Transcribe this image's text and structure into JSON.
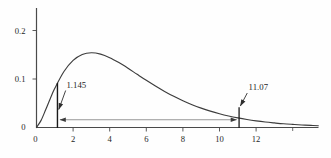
{
  "chart_data": {
    "type": "line",
    "title": "",
    "xlabel": "",
    "ylabel": "",
    "xlim": [
      0,
      15.4
    ],
    "ylim": [
      0,
      0.25
    ],
    "grid": false,
    "legend": false,
    "x_tick_values": [
      0,
      2,
      4,
      6,
      8,
      10,
      12
    ],
    "x_tick_labels": [
      "0",
      "2",
      "4",
      "6",
      "8",
      "10",
      "12"
    ],
    "x_unlabeled_tick_values": [
      14
    ],
    "y_tick_values": [
      0,
      0.1,
      0.2
    ],
    "y_tick_labels": [
      "0",
      "0.1",
      "0.2"
    ],
    "series": [
      {
        "name": "chi-square(5) pdf",
        "points": [
          [
            0,
            0
          ],
          [
            0.25,
            0.0147
          ],
          [
            0.5,
            0.0366
          ],
          [
            0.75,
            0.0594
          ],
          [
            1,
            0.0807
          ],
          [
            1.5,
            0.1154
          ],
          [
            2,
            0.1384
          ],
          [
            2.5,
            0.1506
          ],
          [
            3,
            0.1542
          ],
          [
            3.5,
            0.1513
          ],
          [
            4,
            0.144
          ],
          [
            4.5,
            0.1338
          ],
          [
            5,
            0.1221
          ],
          [
            5.5,
            0.1096
          ],
          [
            6,
            0.0973
          ],
          [
            6.5,
            0.0855
          ],
          [
            7,
            0.0744
          ],
          [
            7.5,
            0.0642
          ],
          [
            8,
            0.0551
          ],
          [
            8.5,
            0.047
          ],
          [
            9,
            0.0399
          ],
          [
            9.5,
            0.0337
          ],
          [
            10,
            0.0283
          ],
          [
            10.5,
            0.0237
          ],
          [
            11,
            0.0198
          ],
          [
            11.5,
            0.0165
          ],
          [
            12,
            0.0137
          ],
          [
            12.5,
            0.0113
          ],
          [
            13,
            0.0094
          ],
          [
            13.5,
            0.0077
          ],
          [
            14,
            0.0064
          ],
          [
            14.5,
            0.0052
          ],
          [
            15,
            0.0043
          ],
          [
            15.4,
            0.0036
          ]
        ]
      }
    ],
    "annotations": [
      {
        "label": "1.145",
        "x": 1.145,
        "marker_top_y": 0.092
      },
      {
        "label": "11.07",
        "x": 11.07,
        "marker_top_y": 0.042
      }
    ],
    "interval_arrow": {
      "x_start": 1.145,
      "x_end": 11.07,
      "y": 0.016
    },
    "colors": {
      "axis": "#4a4a4a",
      "curve": "#3c3c3c",
      "marker_line": "#1a1a1a",
      "leader_arrow": "#2e2e2e",
      "interval_arrow": "#6b6b6b",
      "text": "#1f1f1f"
    }
  }
}
